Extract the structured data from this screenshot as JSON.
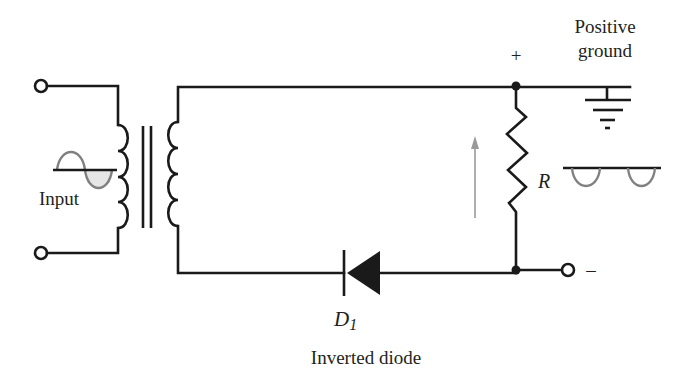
{
  "diagram": {
    "labels": {
      "input": "Input",
      "plus": "+",
      "minus": "–",
      "positive_ground_line1": "Positive",
      "positive_ground_line2": "ground",
      "resistor": "R",
      "diode_letter": "D",
      "diode_subscript": "1",
      "diode_caption": "Inverted diode"
    },
    "components": {
      "transformer": {
        "primary_turns": 4,
        "secondary_turns": 4,
        "core_lines": 2
      },
      "diode": {
        "id": "D1",
        "orientation": "cathode-left (inverted)"
      },
      "resistor": {
        "id": "R"
      },
      "ground": {
        "type": "positive ground",
        "bars": 4
      },
      "terminals": [
        "input-top",
        "input-bottom",
        "output-negative"
      ],
      "nodes": [
        "top-node",
        "bottom-node"
      ]
    },
    "waveforms": {
      "input": "full sine wave",
      "output": "negative half-wave pulses"
    },
    "colors": {
      "wire": "#1a1a1a",
      "waveform": "#808080",
      "waveform_fill": "#e6e6e6",
      "current_arrow": "#9a9a9a",
      "text": "#231f20"
    }
  }
}
